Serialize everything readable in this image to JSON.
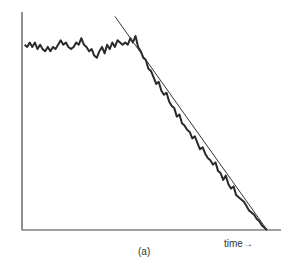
{
  "chart_data": {
    "type": "line",
    "title": "",
    "figure_label": "(a)",
    "xlabel": "time→",
    "ylabel": "",
    "xlim": [
      0,
      100
    ],
    "ylim": [
      0,
      100
    ],
    "grid": false,
    "ticks": false,
    "series": [
      {
        "name": "signal",
        "style": "noisy",
        "color": "#2a2a2a",
        "x": [
          1,
          2,
          3,
          4,
          5,
          6,
          7,
          8,
          9,
          10,
          11,
          12,
          13,
          14,
          15,
          16,
          17,
          18,
          19,
          20,
          21,
          22,
          23,
          24,
          25,
          26,
          27,
          28,
          29,
          30,
          31,
          32,
          33,
          34,
          35,
          36,
          37,
          38,
          39,
          40,
          41,
          42,
          43,
          44,
          45,
          46,
          47,
          48,
          49,
          50,
          51,
          52,
          53,
          54,
          55,
          56,
          57,
          58,
          59,
          60,
          61,
          62,
          63,
          64,
          65,
          66,
          67,
          68,
          69,
          70,
          71,
          72,
          73,
          74,
          75,
          76,
          77,
          78,
          79,
          80,
          81,
          82,
          83,
          84,
          85,
          86,
          87,
          88,
          89,
          90,
          91,
          92,
          93,
          94,
          95
        ],
        "y": [
          85,
          84,
          86,
          84,
          86,
          83,
          85,
          83,
          82,
          84,
          82,
          84,
          83,
          85,
          87,
          85,
          86,
          84,
          83,
          84,
          86,
          85,
          88,
          85,
          84,
          82,
          83,
          80,
          79,
          82,
          84,
          81,
          85,
          83,
          86,
          84,
          87,
          86,
          85,
          86,
          85,
          88,
          86,
          89,
          84,
          82,
          79,
          78,
          74,
          73,
          70,
          67,
          68,
          64,
          62,
          63,
          59,
          57,
          56,
          52,
          53,
          49,
          48,
          46,
          45,
          42,
          43,
          40,
          37,
          38,
          35,
          33,
          32,
          30,
          31,
          27,
          26,
          23,
          25,
          21,
          19,
          20,
          16,
          15,
          14,
          13,
          11,
          9,
          8,
          7,
          5,
          4,
          2,
          1,
          0
        ]
      },
      {
        "name": "fitted line",
        "style": "thin straight",
        "color": "#333333",
        "x": [
          36,
          95
        ],
        "y": [
          98,
          0
        ]
      }
    ]
  }
}
